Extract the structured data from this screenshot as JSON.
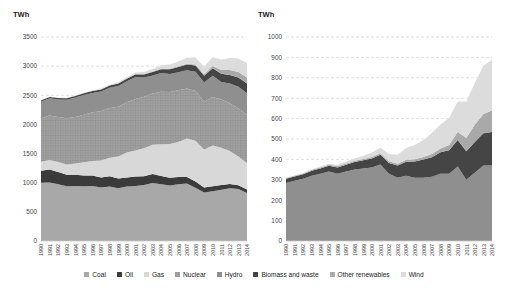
{
  "figure": {
    "background": "#ffffff",
    "text_color": "#3f3f3f",
    "grid_color": "#e0e0e0"
  },
  "chart_data": [
    {
      "type": "area",
      "stacked": true,
      "title": "",
      "ylabel": "TWh",
      "xlabel": "",
      "grid": true,
      "legend_position": "bottom",
      "x": [
        1990,
        1991,
        1992,
        1993,
        1994,
        1995,
        1996,
        1997,
        1998,
        1999,
        2000,
        2001,
        2002,
        2003,
        2004,
        2005,
        2006,
        2007,
        2008,
        2009,
        2010,
        2011,
        2012,
        2013,
        2014
      ],
      "ylim": [
        0,
        3500
      ],
      "ytick_step": 500,
      "series": [
        {
          "name": "Coal",
          "color": "#a8a8a8",
          "values": [
            1000,
            1005,
            975,
            940,
            945,
            940,
            945,
            920,
            935,
            905,
            935,
            945,
            960,
            995,
            975,
            950,
            975,
            985,
            915,
            830,
            855,
            880,
            905,
            890,
            825
          ]
        },
        {
          "name": "Oil",
          "color": "#3b3b3b",
          "values": [
            205,
            220,
            210,
            195,
            190,
            185,
            180,
            170,
            175,
            165,
            155,
            160,
            150,
            155,
            140,
            135,
            125,
            115,
            105,
            90,
            85,
            80,
            75,
            65,
            60
          ]
        },
        {
          "name": "Gas",
          "color": "#d8d8d8",
          "values": [
            155,
            165,
            170,
            180,
            195,
            225,
            245,
            290,
            320,
            380,
            430,
            450,
            480,
            500,
            545,
            580,
            600,
            660,
            700,
            650,
            700,
            640,
            565,
            495,
            450
          ]
        },
        {
          "name": "Nuclear",
          "color": "#9e9e9e",
          "texture": "#8a8a8a",
          "values": [
            745,
            765,
            770,
            790,
            800,
            815,
            840,
            845,
            850,
            855,
            860,
            880,
            885,
            880,
            900,
            890,
            885,
            855,
            855,
            820,
            830,
            830,
            820,
            825,
            830
          ]
        },
        {
          "name": "Hydro",
          "color": "#8f8f8f",
          "values": [
            285,
            295,
            305,
            320,
            330,
            340,
            330,
            340,
            350,
            355,
            360,
            375,
            330,
            310,
            320,
            310,
            310,
            315,
            330,
            330,
            365,
            300,
            335,
            370,
            370
          ]
        },
        {
          "name": "Biomass and waste",
          "color": "#454545",
          "values": [
            20,
            21,
            22,
            24,
            26,
            29,
            31,
            34,
            37,
            41,
            45,
            48,
            53,
            60,
            68,
            80,
            89,
            96,
            105,
            115,
            130,
            140,
            150,
            158,
            165
          ]
        },
        {
          "name": "Other renewables",
          "color": "#a9a9a9",
          "values": [
            4,
            4,
            4,
            5,
            5,
            5,
            6,
            6,
            6,
            6,
            7,
            7,
            8,
            9,
            10,
            11,
            13,
            15,
            18,
            25,
            40,
            65,
            85,
            95,
            105
          ]
        },
        {
          "name": "Wind",
          "color": "#dcdcdc",
          "values": [
            1,
            1,
            2,
            3,
            4,
            5,
            7,
            9,
            12,
            16,
            22,
            27,
            35,
            44,
            58,
            70,
            82,
            104,
            118,
            133,
            149,
            179,
            205,
            235,
            250
          ]
        }
      ]
    },
    {
      "type": "area",
      "stacked": true,
      "title": "",
      "ylabel": "TWh",
      "xlabel": "",
      "grid": true,
      "legend_position": "bottom",
      "x": [
        1990,
        1991,
        1992,
        1993,
        1994,
        1995,
        1996,
        1997,
        1998,
        1999,
        2000,
        2001,
        2002,
        2003,
        2004,
        2005,
        2006,
        2007,
        2008,
        2009,
        2010,
        2011,
        2012,
        2013,
        2014
      ],
      "ylim": [
        0,
        1000
      ],
      "ytick_step": 100,
      "series": [
        {
          "name": "Hydro",
          "color": "#8f8f8f",
          "values": [
            285,
            295,
            305,
            320,
            330,
            340,
            330,
            340,
            350,
            355,
            360,
            375,
            330,
            310,
            320,
            310,
            310,
            315,
            330,
            330,
            365,
            300,
            335,
            370,
            370
          ]
        },
        {
          "name": "Biomass and waste",
          "color": "#454545",
          "values": [
            20,
            21,
            22,
            24,
            26,
            29,
            31,
            34,
            37,
            41,
            45,
            48,
            53,
            60,
            68,
            80,
            89,
            96,
            105,
            115,
            130,
            140,
            150,
            158,
            165
          ]
        },
        {
          "name": "Other renewables",
          "color": "#a9a9a9",
          "values": [
            4,
            4,
            4,
            5,
            5,
            5,
            6,
            6,
            6,
            6,
            7,
            7,
            8,
            9,
            10,
            11,
            13,
            15,
            18,
            25,
            40,
            65,
            85,
            95,
            105
          ]
        },
        {
          "name": "Wind",
          "color": "#dcdcdc",
          "values": [
            1,
            1,
            2,
            3,
            4,
            5,
            7,
            9,
            12,
            16,
            22,
            27,
            35,
            44,
            58,
            70,
            82,
            104,
            118,
            133,
            149,
            179,
            205,
            235,
            250
          ]
        }
      ]
    }
  ]
}
